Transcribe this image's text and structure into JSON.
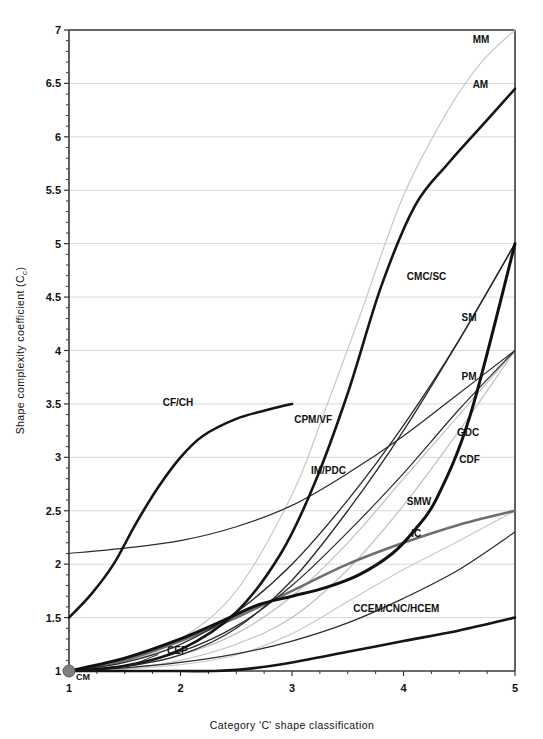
{
  "chart_data": {
    "type": "line",
    "title": "",
    "xlabel": "Category 'C' shape classification",
    "ylabel": "Shape complexity coefficient (C_c)",
    "ylabel_main": "Shape complexity coefficient (C",
    "ylabel_sub": "c",
    "ylabel_tail": ")",
    "xlim": [
      1,
      5
    ],
    "ylim": [
      1,
      7
    ],
    "xticks": [
      "1",
      "2",
      "3",
      "4",
      "5"
    ],
    "yticks": [
      "1",
      "1.5",
      "2",
      "2.5",
      "3",
      "3.5",
      "4",
      "4.5",
      "5",
      "5.5",
      "6",
      "6.5",
      "7"
    ],
    "ytick_values": [
      1,
      1.5,
      2,
      2.5,
      3,
      3.5,
      4,
      4.5,
      5,
      5.5,
      6,
      6.5,
      7
    ],
    "xtick_values": [
      1,
      2,
      3,
      4,
      5
    ],
    "grid": true,
    "legend_position": "inline-labels",
    "origin_marker": {
      "label": "CM",
      "x": 1,
      "y": 1,
      "color": "#808080"
    },
    "series": [
      {
        "name": "MM",
        "label": "MM",
        "color": "#c8c8c8",
        "width": 1.2,
        "label_x": 4.62,
        "label_y": 6.88,
        "x": [
          1,
          1.5,
          2,
          2.5,
          3,
          3.3,
          3.6,
          4,
          4.4,
          4.7,
          5
        ],
        "values": [
          1.0,
          1.08,
          1.3,
          1.75,
          2.65,
          3.45,
          4.3,
          5.45,
          6.25,
          6.7,
          7.0
        ]
      },
      {
        "name": "AM",
        "label": "AM",
        "color": "#151515",
        "width": 2.6,
        "label_x": 4.62,
        "label_y": 6.46,
        "x": [
          1,
          1.5,
          2,
          2.5,
          2.9,
          3.2,
          3.5,
          3.8,
          4.1,
          4.4,
          4.7,
          5
        ],
        "values": [
          1.0,
          1.05,
          1.2,
          1.55,
          2.1,
          2.75,
          3.6,
          4.6,
          5.35,
          5.75,
          6.1,
          6.45
        ]
      },
      {
        "name": "CF/CH",
        "label": "CF/CH",
        "color": "#151515",
        "width": 2.6,
        "label_x": 1.84,
        "label_y": 3.48,
        "x": [
          1,
          1.2,
          1.4,
          1.6,
          1.8,
          2.0,
          2.2,
          2.5,
          2.8,
          3.0
        ],
        "values": [
          1.5,
          1.72,
          2.0,
          2.38,
          2.72,
          3.0,
          3.2,
          3.36,
          3.45,
          3.5
        ]
      },
      {
        "name": "CMC/SC",
        "label": "CMC/SC",
        "color": "#2a2a2a",
        "width": 1.3,
        "label_x": 4.03,
        "label_y": 4.66,
        "x": [
          1,
          1.5,
          2,
          2.5,
          3,
          3.5,
          4,
          4.5,
          5
        ],
        "values": [
          1.0,
          1.04,
          1.15,
          1.4,
          1.85,
          2.5,
          3.25,
          4.1,
          5.0
        ]
      },
      {
        "name": "SM",
        "label": "SM",
        "color": "#111111",
        "width": 3.0,
        "label_x": 4.52,
        "label_y": 4.28,
        "x": [
          1,
          1.5,
          2,
          2.4,
          2.7,
          3.0,
          3.3,
          3.6,
          3.9,
          4.1,
          4.3,
          4.6,
          5
        ],
        "values": [
          1.0,
          1.12,
          1.3,
          1.48,
          1.62,
          1.7,
          1.78,
          1.9,
          2.1,
          2.32,
          2.62,
          3.4,
          5.0
        ]
      },
      {
        "name": "CPM/VF",
        "label": "CPM/VF",
        "color": "#2a2a2a",
        "width": 1.2,
        "label_x": 3.02,
        "label_y": 3.32,
        "x": [
          1,
          1.5,
          2,
          2.5,
          3,
          3.5,
          4,
          4.5,
          5
        ],
        "values": [
          2.1,
          2.15,
          2.22,
          2.35,
          2.55,
          2.85,
          3.2,
          3.6,
          4.0
        ]
      },
      {
        "name": "PM",
        "label": "PM",
        "color": "#2a2a2a",
        "width": 1.2,
        "label_x": 4.52,
        "label_y": 3.72,
        "x": [
          1,
          1.5,
          2,
          2.5,
          3,
          3.5,
          4,
          4.5,
          5
        ],
        "values": [
          1.0,
          1.05,
          1.18,
          1.42,
          1.8,
          2.3,
          2.85,
          3.45,
          4.0
        ]
      },
      {
        "name": "GDC",
        "label": "GDC",
        "color": "#c0c0c0",
        "width": 1.2,
        "label_x": 4.48,
        "label_y": 3.2,
        "x": [
          1,
          1.5,
          2,
          2.5,
          3,
          3.5,
          4,
          4.5,
          5
        ],
        "values": [
          1.0,
          1.05,
          1.15,
          1.35,
          1.7,
          2.2,
          2.8,
          3.4,
          4.0
        ]
      },
      {
        "name": "CDF",
        "label": "CDF",
        "color": "#c0c0c0",
        "width": 1.2,
        "label_x": 4.5,
        "label_y": 2.95,
        "x": [
          1,
          1.5,
          2,
          2.5,
          3,
          3.5,
          4,
          4.5,
          5
        ],
        "values": [
          1.0,
          1.02,
          1.1,
          1.25,
          1.5,
          1.95,
          2.55,
          3.25,
          4.0
        ]
      },
      {
        "name": "IM/PDC",
        "label": "IM/PDC",
        "color": "#2a2a2a",
        "width": 1.3,
        "label_x": 3.17,
        "label_y": 2.84,
        "x": [
          1,
          1.5,
          2,
          2.5,
          3,
          3.5,
          4,
          4.5,
          5
        ],
        "values": [
          1.0,
          1.08,
          1.25,
          1.55,
          2.0,
          2.6,
          3.3,
          4.1,
          5.0
        ]
      },
      {
        "name": "SMW",
        "label": "SMW",
        "color": "#6e6e6e",
        "width": 2.6,
        "label_x": 4.03,
        "label_y": 2.55,
        "x": [
          1,
          1.5,
          2,
          2.5,
          3,
          3.5,
          4,
          4.5,
          5
        ],
        "values": [
          1.0,
          1.1,
          1.28,
          1.5,
          1.75,
          2.0,
          2.2,
          2.37,
          2.5
        ]
      },
      {
        "name": "IC",
        "label": "IC",
        "color": "#cacaca",
        "width": 1.2,
        "label_x": 4.07,
        "label_y": 2.25,
        "x": [
          1,
          1.5,
          2,
          2.5,
          3,
          3.5,
          4,
          4.5,
          5
        ],
        "values": [
          1.0,
          1.02,
          1.06,
          1.15,
          1.35,
          1.65,
          1.95,
          2.22,
          2.5
        ]
      },
      {
        "name": "CEP",
        "label": "CEP",
        "color": "#2a2a2a",
        "width": 1.2,
        "label_x": 1.88,
        "label_y": 1.16,
        "x": [
          1,
          1.5,
          2,
          2.5,
          3,
          3.5,
          4,
          4.5,
          5
        ],
        "values": [
          1.0,
          1.03,
          1.08,
          1.16,
          1.28,
          1.45,
          1.68,
          1.95,
          2.3
        ]
      },
      {
        "name": "CCEM/CNC/HCEM",
        "label": "CCEM/CNC/HCEM",
        "color": "#151515",
        "width": 2.6,
        "label_x": 3.55,
        "label_y": 1.55,
        "x": [
          1,
          1.5,
          2,
          2.3,
          2.6,
          3,
          3.5,
          4,
          4.5,
          5
        ],
        "values": [
          1.0,
          1.0,
          1.0,
          1.0,
          1.02,
          1.08,
          1.18,
          1.28,
          1.38,
          1.5
        ]
      }
    ]
  },
  "plot": {
    "left": 69,
    "top": 30,
    "right": 515,
    "bottom": 671,
    "axis_color": "#444444",
    "grid_color": "#d9d9d9"
  }
}
